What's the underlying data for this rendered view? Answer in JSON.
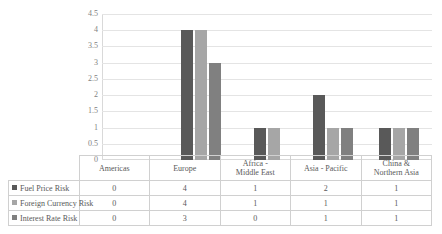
{
  "title_sliver": "",
  "chart_data": {
    "type": "bar",
    "title": "",
    "xlabel": "",
    "ylabel": "",
    "ylim": [
      0,
      4.5
    ],
    "grid": true,
    "legend_position": "table-left",
    "yticks": [
      "4.5",
      "4",
      "3.5",
      "3",
      "2.5",
      "2",
      "1.5",
      "1",
      "0.5",
      "0"
    ],
    "ytick_values": [
      4.5,
      4,
      3.5,
      3,
      2.5,
      2,
      1.5,
      1,
      0.5,
      0
    ],
    "categories": [
      "Americas",
      "Europe",
      "Africa - Middle East",
      "Asia - Pacific",
      "China & Northern Asia"
    ],
    "series": [
      {
        "name": "Fuel Price Risk",
        "color": "#595959",
        "values": [
          0,
          4,
          1,
          2,
          1
        ]
      },
      {
        "name": "Foreign Currency Risk",
        "color": "#a6a6a6",
        "values": [
          0,
          4,
          1,
          1,
          1
        ]
      },
      {
        "name": "Interest Rate Risk",
        "color": "#808080",
        "values": [
          0,
          3,
          0,
          1,
          1
        ]
      }
    ]
  },
  "table": {
    "category_labels": [
      [
        "Americas"
      ],
      [
        "Europe"
      ],
      [
        "Africa -",
        "Middle East"
      ],
      [
        "Asia - Pacific"
      ],
      [
        "China &",
        "Northern Asia"
      ]
    ],
    "rows": [
      {
        "label": "Fuel Price Risk",
        "color": "#595959",
        "cells": [
          "0",
          "4",
          "1",
          "2",
          "1"
        ]
      },
      {
        "label": "Foreign Currency Risk",
        "color": "#a6a6a6",
        "cells": [
          "0",
          "4",
          "1",
          "1",
          "1"
        ]
      },
      {
        "label": "Interest Rate Risk",
        "color": "#808080",
        "cells": [
          "0",
          "3",
          "0",
          "1",
          "1"
        ]
      }
    ]
  }
}
